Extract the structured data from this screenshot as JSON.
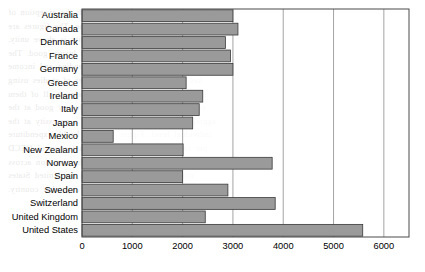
{
  "chart_data": {
    "type": "bar",
    "orientation": "horizontal",
    "title": "",
    "subtitle": "",
    "xlabel": "",
    "ylabel": "",
    "xlim": [
      0,
      6500
    ],
    "ylim": null,
    "grid": "vertical-gridlines-at-major-x-ticks",
    "legend": null,
    "legend_position": "none",
    "categories": [
      "Australia",
      "Canada",
      "Denmark",
      "France",
      "Germany",
      "Greece",
      "Ireland",
      "Italy",
      "Japan",
      "Mexico",
      "New Zealand",
      "Norway",
      "Spain",
      "Sweden",
      "Switzerland",
      "United Kingdom",
      "United States"
    ],
    "values": [
      3000,
      3100,
      2850,
      2950,
      3000,
      2070,
      2400,
      2330,
      2200,
      620,
      2010,
      3780,
      2000,
      2900,
      3840,
      2450,
      5580
    ],
    "x_ticks": [
      0,
      1000,
      2000,
      3000,
      4000,
      5000,
      6000
    ],
    "x_tick_labels": [
      "0",
      "1000",
      "2000",
      "3000",
      "4000",
      "5000",
      "6000"
    ],
    "bar_color": "#9a9a9a",
    "bar_edge_color": "#3a3a3a",
    "grid_color": "#8d8d8d",
    "frame_color": "#4a4a4a",
    "background_color": "#ffffff"
  },
  "background_text": {
    "lines": [
      "in the industrialised countries with the exception of",
      "health care expenditure and income. The figures are",
      "that the average income elasticity is above unity,",
      "suggesting that health care is a luxury good. The",
      "relationship between health care spending and income",
      "has been examined in a number of studies using",
      "international comparisons, and almost all of them",
      "conclude that health care is a luxury good at the",
      "aggregate level, even though it is a necessity at the",
      "individual level. Figure 1 shows health expenditure",
      "per capita in US dollars for a selection of OECD",
      "countries in a recent year. The variation across",
      "countries is substantial, with the United States",
      "spending far more than any other country."
    ]
  }
}
